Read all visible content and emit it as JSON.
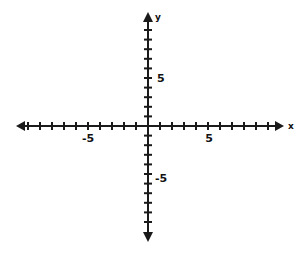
{
  "figure": {
    "title": "",
    "background_color": "#ffffff",
    "axis_color": "#1a1a1a",
    "label_color": "#111111",
    "width": 302,
    "height": 253
  },
  "axes": {
    "x": {
      "name": "x",
      "label_x": 291,
      "label_y": 129,
      "line_start_x": 16,
      "line_end_x": 284,
      "line_y": 126,
      "tick_half_height": 4,
      "tick_spacing": 12.0,
      "ticks_negative": 11,
      "ticks_positive": 11,
      "arrow_left": true,
      "arrow_right": true
    },
    "y": {
      "name": "y",
      "label_x": 158,
      "label_y": 20,
      "line_start_y": 12,
      "line_end_y": 242,
      "line_x": 148,
      "tick_half_width": 4,
      "tick_spacing": 9.6,
      "ticks_positive": 10,
      "ticks_negative": 10,
      "arrow_up": true,
      "arrow_down": true
    }
  },
  "origin": {
    "x": 148,
    "y": 126
  },
  "tick_labels": [
    {
      "text": "-5",
      "axis": "x",
      "value": -5,
      "x": 88,
      "y": 142,
      "anchor": "middle"
    },
    {
      "text": "5",
      "axis": "x",
      "value": 5,
      "x": 209,
      "y": 142,
      "anchor": "middle"
    },
    {
      "text": "5",
      "axis": "y",
      "value": 5,
      "x": 157,
      "y": 82,
      "anchor": "start"
    },
    {
      "text": "-5",
      "axis": "y",
      "value": -5,
      "x": 155,
      "y": 182,
      "anchor": "start"
    }
  ],
  "chart_data": {
    "type": "scatter",
    "title": "",
    "xlabel": "x",
    "ylabel": "y",
    "x": [],
    "y": [],
    "series": [],
    "xlim": [
      -11,
      11
    ],
    "ylim": [
      -10,
      10
    ],
    "xticks": [
      -11,
      -10,
      -9,
      -8,
      -7,
      -6,
      -5,
      -4,
      -3,
      -2,
      -1,
      0,
      1,
      2,
      3,
      4,
      5,
      6,
      7,
      8,
      9,
      10,
      11
    ],
    "yticks": [
      -10,
      -9,
      -8,
      -7,
      -6,
      -5,
      -4,
      -3,
      -2,
      -1,
      0,
      1,
      2,
      3,
      4,
      5,
      6,
      7,
      8,
      9,
      10
    ],
    "xtick_labels_shown": [
      "-5",
      "5"
    ],
    "ytick_labels_shown": [
      "5",
      "-5"
    ],
    "grid": false,
    "legend": null,
    "annotations": []
  }
}
